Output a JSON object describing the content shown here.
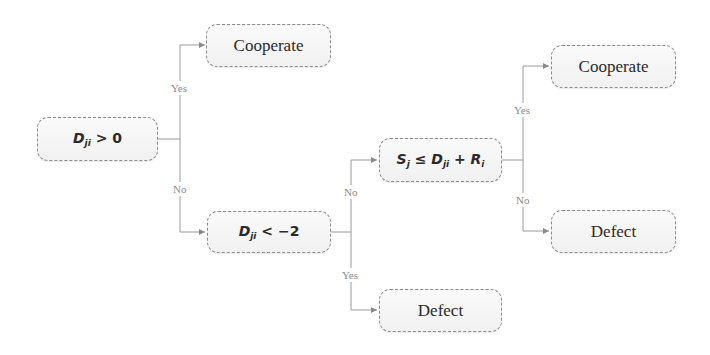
{
  "nodes": {
    "d_gt_0": {
      "var": "D",
      "sub": "ji",
      "rest": " > 0"
    },
    "coop_1": {
      "label": "Cooperate"
    },
    "d_lt_m2": {
      "var": "D",
      "sub": "ji",
      "rest": " < −2"
    },
    "sj_cond": {
      "var1": "S",
      "sub1": "j",
      "op": " ≤ ",
      "var2": "D",
      "sub2": "ji",
      "plus": " + ",
      "var3": "R",
      "sub3": "i"
    },
    "defect_bottom": {
      "label": "Defect"
    },
    "coop_2": {
      "label": "Cooperate"
    },
    "defect_right": {
      "label": "Defect"
    }
  },
  "edge_labels": {
    "e1_yes": "Yes",
    "e1_no": "No",
    "e2_no": "No",
    "e2_yes": "Yes",
    "e3_yes": "Yes",
    "e3_no": "No"
  },
  "colors": {
    "line": "#9a9a9a",
    "border": "#8a8a8a",
    "text": "#2a2a2a",
    "label": "#8a8a8a"
  }
}
